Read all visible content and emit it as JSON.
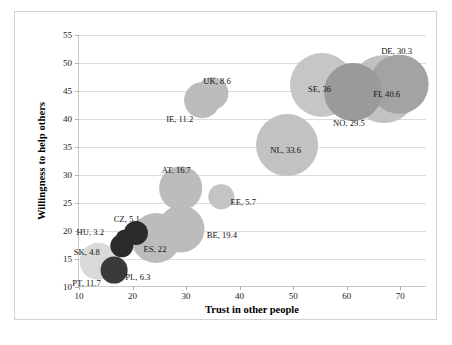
{
  "chart_data": {
    "type": "scatter",
    "title": "",
    "xlabel": "Trust in other people",
    "ylabel": "Willingness to help others",
    "xlim": [
      10,
      75
    ],
    "ylim": [
      10,
      55
    ],
    "xticks": [
      10,
      20,
      30,
      40,
      50,
      60,
      70
    ],
    "yticks": [
      10,
      15,
      20,
      25,
      30,
      35,
      40,
      45,
      50,
      55
    ],
    "grid": "horizontal",
    "legend": "none",
    "bubble_size_note": "bubble area encodes the third value shown in each label",
    "points": [
      {
        "code": "PT",
        "label": "PT, 11.7",
        "x": 13.6,
        "y": 14.6,
        "size": 11.7,
        "color": "#d9d9d9",
        "label_dx": -26,
        "label_dy": 18
      },
      {
        "code": "PL",
        "label": "PL, 6.3",
        "x": 16.6,
        "y": 13.0,
        "size": 6.3,
        "color": "#3a3a3a",
        "label_dx": 11,
        "label_dy": 3
      },
      {
        "code": "SK",
        "label": "SK, 4.8",
        "x": 18.0,
        "y": 17.4,
        "size": 4.8,
        "color": "#2b2b2b",
        "label_dx": -48,
        "label_dy": 2
      },
      {
        "code": "HU",
        "label": "HU, 3.2",
        "x": 18.5,
        "y": 18.6,
        "size": 3.2,
        "color": "#2b2b2b",
        "label_dx": -48,
        "label_dy": -11
      },
      {
        "code": "CZ",
        "label": "CZ, 5.1",
        "x": 20.6,
        "y": 19.6,
        "size": 5.1,
        "color": "#2b2b2b",
        "label_dx": -22,
        "label_dy": -18
      },
      {
        "code": "ES",
        "label": "ES, 22",
        "x": 24.3,
        "y": 18.8,
        "size": 22.0,
        "color": "#bcbcbc",
        "label_dx": -12,
        "label_dy": 7
      },
      {
        "code": "BE",
        "label": "BE, 19.4",
        "x": 29.0,
        "y": 20.4,
        "size": 19.4,
        "color": "#bcbcbc",
        "label_dx": 26,
        "label_dy": 2
      },
      {
        "code": "AT",
        "label": "AT, 16.7",
        "x": 29.0,
        "y": 27.6,
        "size": 16.7,
        "color": "#bcbcbc",
        "label_dx": -19,
        "label_dy": -22
      },
      {
        "code": "IE",
        "label": "IE, 11.2",
        "x": 33.0,
        "y": 43.4,
        "size": 11.2,
        "color": "#bcbcbc",
        "label_dx": -36,
        "label_dy": 15
      },
      {
        "code": "UK",
        "label": "UK, 8.6",
        "x": 34.9,
        "y": 44.6,
        "size": 8.6,
        "color": "#bcbcbc",
        "label_dx": -9,
        "label_dy": -16
      },
      {
        "code": "EE",
        "label": "EE, 5.7",
        "x": 36.6,
        "y": 26.1,
        "size": 5.7,
        "color": "#c4c4c4",
        "label_dx": 9,
        "label_dy": 1
      },
      {
        "code": "NL",
        "label": "NL, 33.6",
        "x": 48.9,
        "y": 35.4,
        "size": 33.6,
        "color": "#c2c2c2",
        "label_dx": -17,
        "label_dy": 1
      },
      {
        "code": "SE",
        "label": "SE, 36",
        "x": 55.4,
        "y": 46.0,
        "size": 36.0,
        "color": "#c6c6c6",
        "label_dx": -14,
        "label_dy": 0
      },
      {
        "code": "NO",
        "label": "NO, 29.5",
        "x": 61.2,
        "y": 44.8,
        "size": 29.5,
        "color": "#9a9a9a",
        "label_dx": -20,
        "label_dy": 27
      },
      {
        "code": "FI",
        "label": "FI, 40.6",
        "x": 67.0,
        "y": 45.3,
        "size": 40.6,
        "color": "#c2c2c2",
        "label_dx": -11,
        "label_dy": 1
      },
      {
        "code": "DE",
        "label": "DE, 30.3",
        "x": 69.8,
        "y": 46.2,
        "size": 30.3,
        "color": "#a3a3a3",
        "label_dx": -18,
        "label_dy": -37
      }
    ]
  },
  "caption": {
    "text": ""
  }
}
